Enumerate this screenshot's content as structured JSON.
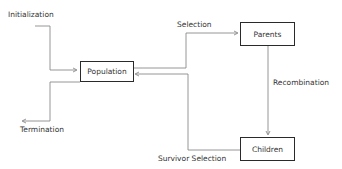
{
  "diagram": {
    "type": "flowchart",
    "nodes": [
      {
        "id": "population",
        "label": "Population"
      },
      {
        "id": "parents",
        "label": "Parents"
      },
      {
        "id": "children",
        "label": "Children"
      }
    ],
    "edges": [
      {
        "from": "start",
        "to": "population",
        "label": "Initialization"
      },
      {
        "from": "population",
        "to": "parents",
        "label": "Selection"
      },
      {
        "from": "parents",
        "to": "children",
        "label": "Recombination"
      },
      {
        "from": "children",
        "to": "population",
        "label": "Survivor Selection"
      },
      {
        "from": "population",
        "to": "end",
        "label": "Termination"
      }
    ]
  },
  "labels": {
    "initialization": "Initialization",
    "selection": "Selection",
    "recombination": "Recombination",
    "survivor_selection": "Survivor Selection",
    "termination": "Termination"
  },
  "boxes": {
    "population": "Population",
    "parents": "Parents",
    "children": "Children"
  },
  "colors": {
    "line": "#8a8a8a",
    "box_border": "#2a2a2a",
    "text": "#333333"
  }
}
